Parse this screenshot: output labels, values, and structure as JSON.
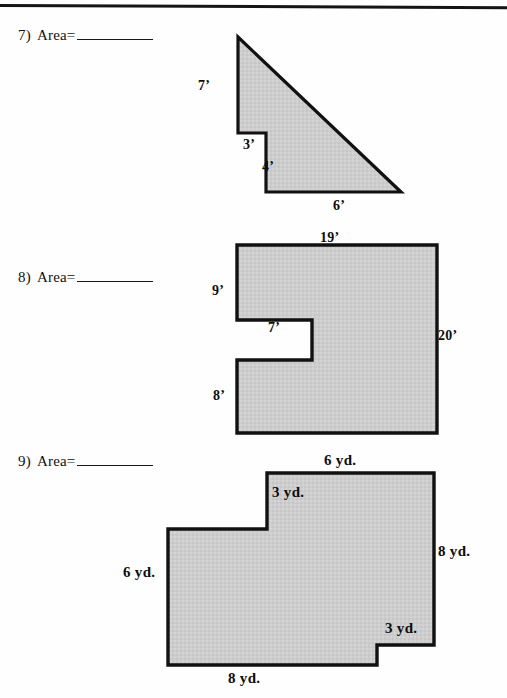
{
  "page": {
    "width": 507,
    "height": 698,
    "rule_color": "#141414",
    "shape_fill": "#cdcdcd",
    "shape_stroke": "#111111"
  },
  "problems": [
    {
      "id": "problem-7",
      "number": "7)",
      "label": "Area=",
      "answer_blank": "",
      "figure": {
        "name": "step-right-triangle",
        "labels": [
          {
            "name": "dim-7ft",
            "text": "7’",
            "x": 198,
            "y": 78
          },
          {
            "name": "dim-3ft",
            "text": "3’",
            "x": 243,
            "y": 137
          },
          {
            "name": "dim-4ft",
            "text": "4’",
            "x": 262,
            "y": 159
          },
          {
            "name": "dim-6ft",
            "text": "6’",
            "x": 333,
            "y": 198
          }
        ]
      }
    },
    {
      "id": "problem-8",
      "number": "8)",
      "label": "Area=",
      "answer_blank": "",
      "figure": {
        "name": "notched-rectangle",
        "labels": [
          {
            "name": "dim-19ft",
            "text": "19’",
            "x": 320,
            "y": 230
          },
          {
            "name": "dim-9ft",
            "text": "9’",
            "x": 212,
            "y": 283
          },
          {
            "name": "dim-7ft",
            "text": "7’",
            "x": 268,
            "y": 320
          },
          {
            "name": "dim-8ft",
            "text": "8’",
            "x": 213,
            "y": 388
          },
          {
            "name": "dim-20ft",
            "text": "20’",
            "x": 438,
            "y": 328
          }
        ]
      }
    },
    {
      "id": "problem-9",
      "number": "9)",
      "label": "Area=",
      "answer_blank": "",
      "figure": {
        "name": "stepped-polygon",
        "labels": [
          {
            "name": "dim-6yd-top",
            "text": "6 yd.",
            "x": 324,
            "y": 452
          },
          {
            "name": "dim-3yd-top",
            "text": "3 yd.",
            "x": 272,
            "y": 484
          },
          {
            "name": "dim-8yd-right",
            "text": "8 yd.",
            "x": 438,
            "y": 543
          },
          {
            "name": "dim-6yd-left",
            "text": "6 yd.",
            "x": 123,
            "y": 564
          },
          {
            "name": "dim-3yd-bottom",
            "text": "3 yd.",
            "x": 385,
            "y": 620
          },
          {
            "name": "dim-8yd-bottom",
            "text": "8 yd.",
            "x": 228,
            "y": 670
          }
        ]
      }
    }
  ]
}
